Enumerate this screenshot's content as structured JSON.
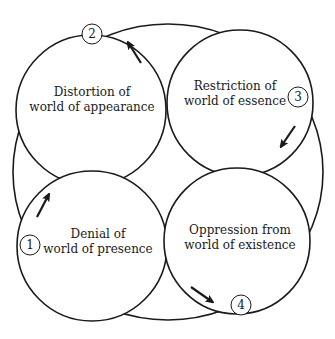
{
  "diagram": {
    "type": "four-circle cycle diagram",
    "stroke_color": "#1a1a1a",
    "background_color": "#ffffff",
    "outer_ellipse": {
      "cx": 168,
      "cy": 172,
      "rx": 155,
      "ry": 148
    },
    "circles": [
      {
        "id": "distortion",
        "cx": 91,
        "cy": 110,
        "r": 75,
        "label_line1": "Distortion of",
        "label_line2": "world of appearance",
        "label_x": 92,
        "label_y": 100
      },
      {
        "id": "restriction",
        "cx": 240,
        "cy": 103,
        "r": 73,
        "label_line1": "Restriction of",
        "label_line2": "world of essence",
        "label_x": 235,
        "label_y": 94
      },
      {
        "id": "denial",
        "cx": 92,
        "cy": 246,
        "r": 75,
        "label_line1": "Denial of",
        "label_line2": "world of presence",
        "label_x": 98,
        "label_y": 242
      },
      {
        "id": "oppression",
        "cx": 237,
        "cy": 241,
        "r": 73,
        "label_line1": "Oppression from",
        "label_line2": "world of existence",
        "label_x": 240,
        "label_y": 238
      }
    ],
    "badges": [
      {
        "number": "1",
        "x": 30,
        "y": 245
      },
      {
        "number": "2",
        "x": 92,
        "y": 34
      },
      {
        "number": "3",
        "x": 298,
        "y": 97
      },
      {
        "number": "4",
        "x": 241,
        "y": 305
      }
    ],
    "arrows": [
      {
        "from": [
          37,
          217
        ],
        "to": [
          48,
          196
        ],
        "direction": "up-right"
      },
      {
        "from": [
          141,
          63
        ],
        "to": [
          129,
          44
        ],
        "direction": "up-left"
      },
      {
        "from": [
          295,
          126
        ],
        "to": [
          282,
          145
        ],
        "direction": "down-left"
      },
      {
        "from": [
          191,
          287
        ],
        "to": [
          211,
          301
        ],
        "direction": "down-right"
      }
    ]
  }
}
